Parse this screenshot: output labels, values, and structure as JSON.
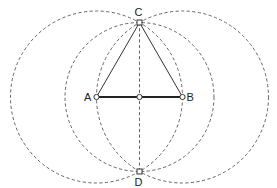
{
  "diagram": {
    "title": "",
    "type": "geometric-construction",
    "colors": {
      "background": "#ffffff",
      "stroke": "#333333",
      "dashed": "#555555"
    },
    "points": [
      {
        "id": "A",
        "label": "A",
        "x": 96.5,
        "y": 97
      },
      {
        "id": "B",
        "label": "B",
        "x": 182.5,
        "y": 97
      },
      {
        "id": "C",
        "label": "C",
        "x": 139.5,
        "y": 22.5
      },
      {
        "id": "D",
        "label": "D",
        "x": 139.5,
        "y": 171.5
      },
      {
        "id": "M",
        "label": "",
        "x": 139.5,
        "y": 97
      }
    ],
    "circles": [
      {
        "center": "A",
        "radius": 86,
        "style": "dashed"
      },
      {
        "center": "B",
        "radius": 86,
        "style": "dashed"
      },
      {
        "center": "M",
        "radius": 74.5,
        "style": "dashed"
      }
    ],
    "segments": [
      {
        "from": "A",
        "to": "B",
        "style": "thick"
      },
      {
        "from": "A",
        "to": "C",
        "style": "solid"
      },
      {
        "from": "B",
        "to": "C",
        "style": "solid"
      },
      {
        "from": "C",
        "to": "D",
        "style": "dashed"
      }
    ],
    "labels": {
      "A": "A",
      "B": "B",
      "C": "C",
      "D": "D"
    }
  }
}
